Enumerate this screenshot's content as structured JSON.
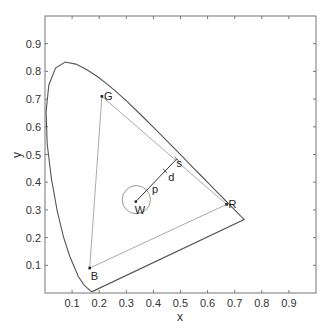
{
  "chart_data": {
    "type": "line",
    "title": "",
    "xlabel": "x",
    "ylabel": "y",
    "xlim": [
      0,
      1
    ],
    "ylim": [
      0,
      1
    ],
    "grid": false,
    "xticks": [
      0.1,
      0.2,
      0.3,
      0.4,
      0.5,
      0.6,
      0.7,
      0.8,
      0.9
    ],
    "yticks": [
      0.1,
      0.2,
      0.3,
      0.4,
      0.5,
      0.6,
      0.7,
      0.8,
      0.9
    ],
    "xtick_labels": [
      "0.1",
      "0.2",
      "0.3",
      "0.4",
      "0.5",
      "0.6",
      "0.7",
      "0.8",
      "0.9"
    ],
    "ytick_labels": [
      "0.1",
      "0.2",
      "0.3",
      "0.4",
      "0.5",
      "0.6",
      "0.7",
      "0.8",
      "0.9"
    ],
    "spectral_locus": {
      "name": "CIE 1931 spectral locus",
      "color": "#555555",
      "x": [
        0.1741,
        0.1738,
        0.1733,
        0.1726,
        0.1714,
        0.1689,
        0.1644,
        0.1566,
        0.144,
        0.1241,
        0.0913,
        0.0687,
        0.0454,
        0.0235,
        0.0082,
        0.0039,
        0.0139,
        0.0389,
        0.0743,
        0.1142,
        0.1547,
        0.1929,
        0.2296,
        0.2658,
        0.3016,
        0.3373,
        0.3731,
        0.4087,
        0.4441,
        0.4788,
        0.5125,
        0.5448,
        0.5752,
        0.6029,
        0.627,
        0.6482,
        0.6658,
        0.6801,
        0.6915,
        0.7006,
        0.7079,
        0.714,
        0.719,
        0.723,
        0.726,
        0.7283,
        0.73,
        0.7311,
        0.732,
        0.7334,
        0.7347
      ],
      "y": [
        0.005,
        0.0049,
        0.0048,
        0.0048,
        0.0051,
        0.0069,
        0.0109,
        0.0177,
        0.0297,
        0.0578,
        0.1327,
        0.2007,
        0.295,
        0.4127,
        0.5384,
        0.6548,
        0.7502,
        0.812,
        0.8338,
        0.8262,
        0.8059,
        0.7816,
        0.7543,
        0.7243,
        0.6923,
        0.6589,
        0.6245,
        0.5896,
        0.5547,
        0.5202,
        0.4866,
        0.4544,
        0.4242,
        0.3965,
        0.3725,
        0.3514,
        0.334,
        0.3197,
        0.3083,
        0.2993,
        0.292,
        0.2859,
        0.2809,
        0.277,
        0.274,
        0.2717,
        0.27,
        0.2689,
        0.268,
        0.2666,
        0.2653
      ],
      "closed": true
    },
    "gamut_triangle": {
      "name": "RGB gamut",
      "color": "#aaaaaa",
      "vertices": [
        {
          "label": "R",
          "x": 0.67,
          "y": 0.32
        },
        {
          "label": "G",
          "x": 0.21,
          "y": 0.71
        },
        {
          "label": "B",
          "x": 0.165,
          "y": 0.09
        }
      ]
    },
    "white_point": {
      "label": "W",
      "x": 0.335,
      "y": 0.33
    },
    "tolerance_circle": {
      "center_x": 0.337,
      "center_y": 0.337,
      "radius": 0.052
    },
    "saturation_line": {
      "from": {
        "label": "W",
        "x": 0.335,
        "y": 0.33
      },
      "to": {
        "label": "s",
        "x": 0.486,
        "y": 0.484
      },
      "tick": {
        "x": 0.443,
        "y": 0.441
      },
      "labels": [
        {
          "text": "p",
          "x": 0.395,
          "y": 0.36
        },
        {
          "text": "d",
          "x": 0.455,
          "y": 0.405
        },
        {
          "text": "s",
          "x": 0.485,
          "y": 0.455
        }
      ]
    }
  }
}
